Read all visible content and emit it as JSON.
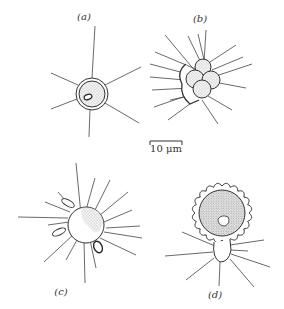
{
  "figure": {
    "panels": [
      {
        "id": "a",
        "label": "(a)",
        "description": "spherical cell with double wall and six radiating spines"
      },
      {
        "id": "b",
        "label": "(b)",
        "description": "cluster of granular cells with many radiating spines"
      },
      {
        "id": "c",
        "label": "(c)",
        "description": "spherical cell with many spines and attached elongated bodies"
      },
      {
        "id": "d",
        "label": "(d)",
        "description": "large cell with scalloped wall atop small spined cell"
      }
    ],
    "scale_bar": {
      "label": "10 μm",
      "value": 10,
      "unit": "μm"
    }
  }
}
